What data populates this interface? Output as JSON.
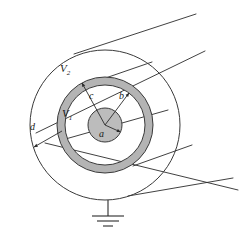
{
  "figure": {
    "background_color": "#ffffff",
    "line_color": "#2b2b2b",
    "shield_fill_color": "#b4b4b4",
    "core_fill_color": "#bcbcbc",
    "labels": {
      "outer_region": {
        "text": "V",
        "subscript": "2"
      },
      "inner_region": {
        "text": "V",
        "subscript": "1"
      },
      "radius_core": "a",
      "radius_shield_inner": "b",
      "radius_shield_outer": "c",
      "radius_outer": "d"
    },
    "icons": {
      "ground": "ground-symbol-icon"
    },
    "geometry": {
      "center_x": 105,
      "center_y": 125,
      "radius_a": 17,
      "radius_b": 40,
      "radius_c": 48,
      "radius_d": 75
    }
  }
}
